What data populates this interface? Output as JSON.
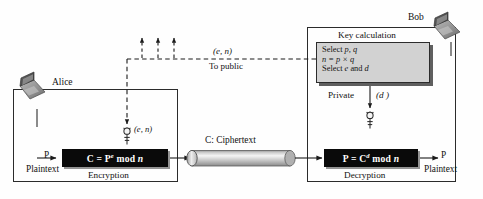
{
  "figure": {
    "type": "rsa-cryptosystem-diagram",
    "background": "#ffffff",
    "ink": "#111111"
  },
  "participants": {
    "alice": {
      "label": "Alice",
      "icon": "laptop-icon"
    },
    "bob": {
      "label": "Bob",
      "icon": "laptop-icon"
    }
  },
  "public_channel": {
    "key_label": "(e, n)",
    "destination_label": "To public",
    "arrow_count": 3
  },
  "alice_side": {
    "input_symbol": "P",
    "input_label": "Plaintext",
    "key_label": "(e, n)",
    "key_icon": "key-icon",
    "formula_prefix": "C = P",
    "formula_exponent": "e",
    "formula_suffix": " mod ",
    "formula_modulus": "n",
    "process_label": "Encryption"
  },
  "channel": {
    "label": "C: Ciphertext",
    "shape": "cylinder-pipe",
    "fill_light": "#f2f2f2",
    "fill_dark": "#8d8d8d"
  },
  "bob_side": {
    "panel_title": "Key calculation",
    "panel_rows": [
      {
        "prefix": "Select ",
        "italic": "p, q",
        "suffix": ""
      },
      {
        "prefix": "",
        "italic": "n = p × q",
        "suffix": ""
      },
      {
        "prefix": "Select ",
        "italic": "e",
        "suffix": " and ",
        "italic2": "d"
      }
    ],
    "private_label": "Private",
    "private_key_value": "(d )",
    "key_icon": "key-icon",
    "formula_prefix": "P = C",
    "formula_exponent": "d",
    "formula_suffix": " mod ",
    "formula_modulus": "n",
    "process_label": "Decryption",
    "output_symbol": "P",
    "output_label": "Plaintext"
  },
  "colors": {
    "panel_fill": "#d2d2d2",
    "panel_shadow": "#5f5f5f",
    "formula_box": "#0a0a0a",
    "formula_text": "#ffffff",
    "stroke": "#2b2b2b"
  }
}
